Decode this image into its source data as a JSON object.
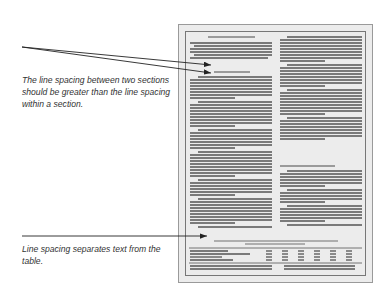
{
  "annotations": [
    {
      "text": "The line spacing between two sections should be greater than the line spacing within a section."
    },
    {
      "text": "Line spacing separates text from the table."
    }
  ],
  "page": {
    "columns": 2,
    "headings": [
      "left-top",
      "left-second",
      "right-middle",
      "table-title"
    ],
    "table": {
      "columns": 6
    }
  },
  "colors": {
    "page_bg": "#ececec",
    "text_line": "#555555",
    "heading_line": "#9a9a9a",
    "arrow": "#222222"
  }
}
